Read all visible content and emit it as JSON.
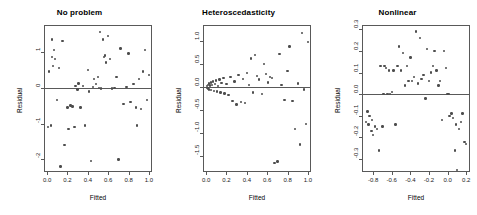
{
  "figure": {
    "background": "#ffffff",
    "point_color": "#4d4d4d",
    "axis_color": "#595959",
    "panel_count": 3
  },
  "chart_data": [
    {
      "type": "scatter",
      "title": "No problem",
      "xlabel": "Fitted",
      "ylabel": "Residual",
      "xlim": [
        -0.03,
        1.03
      ],
      "ylim": [
        -2.35,
        1.75
      ],
      "xticks": [
        0.0,
        0.2,
        0.4,
        0.6,
        0.8,
        1.0
      ],
      "xticklabels": [
        "0.0",
        "0.2",
        "0.4",
        "0.6",
        "0.8",
        "1.0"
      ],
      "yticks": [
        1,
        0,
        -1,
        -2
      ],
      "yticklabels": [
        "1",
        "0",
        "-1",
        "-2"
      ],
      "grid": false,
      "legend": null,
      "hline": 0,
      "x": [
        0.01,
        0.02,
        0.04,
        0.05,
        0.05,
        0.06,
        0.07,
        0.08,
        0.1,
        0.12,
        0.13,
        0.15,
        0.17,
        0.2,
        0.21,
        0.23,
        0.25,
        0.27,
        0.28,
        0.3,
        0.31,
        0.33,
        0.35,
        0.37,
        0.4,
        0.41,
        0.43,
        0.45,
        0.46,
        0.48,
        0.5,
        0.51,
        0.52,
        0.53,
        0.55,
        0.56,
        0.57,
        0.58,
        0.6,
        0.62,
        0.64,
        0.66,
        0.68,
        0.7,
        0.72,
        0.75,
        0.78,
        0.8,
        0.82,
        0.85,
        0.87,
        0.88,
        0.9,
        0.92,
        0.94,
        0.96,
        0.98,
        1.0
      ],
      "y": [
        -1.1,
        0.45,
        -1.05,
        1.35,
        0.85,
        0.6,
        1.05,
        0.8,
        -0.35,
        0.55,
        -2.2,
        1.3,
        -1.6,
        -0.55,
        -1.15,
        -0.5,
        -0.52,
        -1.1,
        0.05,
        -0.05,
        0.12,
        -0.55,
        0.05,
        -1.05,
        0.5,
        -0.1,
        -2.05,
        0.02,
        0.25,
        0.1,
        0.3,
        0.0,
        1.55,
        -0.02,
        1.35,
        0.85,
        0.9,
        0.7,
        1.45,
        0.8,
        -0.02,
        0.0,
        0.3,
        -2.0,
        1.1,
        -0.45,
        0.02,
        0.95,
        -0.4,
        0.1,
        -0.55,
        -1.05,
        0.25,
        -0.6,
        0.45,
        1.05,
        -0.35,
        0.35
      ]
    },
    {
      "type": "scatter",
      "title": "Heteroscedasticity",
      "xlabel": "Fitted",
      "ylabel": "Residual",
      "xlim": [
        -0.03,
        1.03
      ],
      "ylim": [
        -1.85,
        1.35
      ],
      "xticks": [
        0.0,
        0.2,
        0.4,
        0.6,
        0.8,
        1.0
      ],
      "xticklabels": [
        "0.0",
        "0.2",
        "0.4",
        "0.6",
        "0.8",
        "1.0"
      ],
      "yticks": [
        1.0,
        0.5,
        0.0,
        -0.5,
        -1.0,
        -1.5
      ],
      "yticklabels": [
        "1.0",
        "0.5",
        "0.0",
        "-0.5",
        "-1.0",
        "-1.5"
      ],
      "grid": false,
      "legend": null,
      "hline": 0,
      "x": [
        0.01,
        0.01,
        0.02,
        0.02,
        0.03,
        0.03,
        0.04,
        0.05,
        0.05,
        0.06,
        0.07,
        0.08,
        0.09,
        0.1,
        0.11,
        0.12,
        0.13,
        0.14,
        0.15,
        0.17,
        0.18,
        0.2,
        0.22,
        0.24,
        0.26,
        0.28,
        0.3,
        0.32,
        0.34,
        0.36,
        0.38,
        0.4,
        0.42,
        0.44,
        0.46,
        0.48,
        0.5,
        0.52,
        0.55,
        0.57,
        0.59,
        0.61,
        0.63,
        0.65,
        0.67,
        0.7,
        0.72,
        0.74,
        0.77,
        0.8,
        0.82,
        0.85,
        0.87,
        0.9,
        0.92,
        0.94,
        0.96,
        0.98,
        1.0
      ],
      "y": [
        0.02,
        -0.02,
        0.05,
        -0.03,
        0.08,
        -0.05,
        0.03,
        0.1,
        -0.06,
        0.04,
        0.12,
        -0.08,
        0.06,
        0.14,
        -0.1,
        0.02,
        0.16,
        -0.12,
        0.09,
        0.2,
        -0.14,
        0.07,
        -0.18,
        0.22,
        -0.3,
        0.12,
        -0.38,
        0.26,
        -0.32,
        0.18,
        -0.35,
        0.3,
        0.05,
        0.62,
        -0.12,
        0.7,
        0.24,
        0.16,
        -0.15,
        0.5,
        0.28,
        0.1,
        0.22,
        0.2,
        -1.65,
        -1.62,
        0.72,
        0.05,
        -0.28,
        0.35,
        0.88,
        -0.3,
        -0.92,
        0.08,
        -1.25,
        1.18,
        -0.05,
        -0.8,
        0.98
      ]
    },
    {
      "type": "scatter",
      "title": "Nonlinear",
      "xlabel": "Fitted",
      "ylabel": "Residual",
      "xlim": [
        -0.92,
        0.24
      ],
      "ylim": [
        -0.36,
        0.32
      ],
      "xticks": [
        -0.8,
        -0.6,
        -0.4,
        -0.2,
        0.0,
        0.2
      ],
      "xticklabels": [
        "-0.8",
        "-0.6",
        "-0.4",
        "-0.2",
        "0.0",
        "0.2"
      ],
      "yticks": [
        0.3,
        0.2,
        0.1,
        0.0,
        -0.1,
        -0.2,
        -0.3
      ],
      "yticklabels": [
        "0.3",
        "0.2",
        "0.1",
        "0.0",
        "-0.1",
        "-0.2",
        "-0.3"
      ],
      "grid": false,
      "legend": null,
      "hline": 0,
      "x": [
        -0.88,
        -0.86,
        -0.85,
        -0.84,
        -0.82,
        -0.81,
        -0.8,
        -0.78,
        -0.76,
        -0.74,
        -0.72,
        -0.7,
        -0.69,
        -0.68,
        -0.66,
        -0.65,
        -0.64,
        -0.63,
        -0.62,
        -0.6,
        -0.58,
        -0.56,
        -0.54,
        -0.52,
        -0.5,
        -0.48,
        -0.46,
        -0.44,
        -0.42,
        -0.4,
        -0.38,
        -0.36,
        -0.34,
        -0.32,
        -0.3,
        -0.28,
        -0.26,
        -0.24,
        -0.22,
        -0.2,
        -0.18,
        -0.16,
        -0.14,
        -0.12,
        -0.1,
        -0.08,
        -0.06,
        -0.04,
        -0.02,
        0.0,
        0.01,
        0.02,
        0.04,
        0.06,
        0.08,
        0.09,
        0.1,
        0.12,
        0.14,
        0.16,
        0.18,
        0.2
      ],
      "y": [
        -0.13,
        -0.08,
        -0.14,
        -0.1,
        -0.17,
        -0.12,
        -0.19,
        -0.15,
        -0.16,
        -0.26,
        0.13,
        -0.15,
        0.0,
        0.13,
        0.12,
        0.0,
        0.0,
        0.11,
        0.0,
        0.01,
        0.11,
        -0.14,
        0.13,
        0.22,
        0.11,
        0.19,
        0.04,
        0.13,
        0.06,
        0.17,
        0.06,
        0.08,
        0.29,
        0.05,
        0.26,
        0.07,
        0.09,
        -0.02,
        0.21,
        0.06,
        0.1,
        0.13,
        0.2,
        0.11,
        0.04,
        0.06,
        -0.12,
        0.2,
        0.12,
        0.0,
        0.0,
        -0.1,
        -0.09,
        -0.11,
        -0.26,
        -0.14,
        -0.35,
        -0.16,
        -0.13,
        -0.09,
        -0.22,
        -0.23
      ]
    }
  ]
}
